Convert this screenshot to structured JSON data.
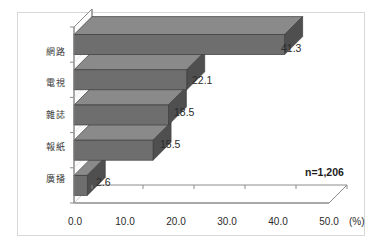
{
  "chart_data": {
    "type": "bar",
    "orientation": "horizontal",
    "style": "3d",
    "title": "",
    "subtitle": "",
    "xlabel": "",
    "ylabel": "",
    "unit_label": "(%)",
    "categories": [
      "網路",
      "電視",
      "雜誌",
      "報紙",
      "廣播"
    ],
    "values": [
      41.3,
      22.1,
      18.5,
      15.5,
      2.6
    ],
    "value_labels": [
      "41.3",
      "22.1",
      "18.5",
      "15.5",
      "2.6"
    ],
    "xlim": [
      0.0,
      50.0
    ],
    "xticks": [
      0.0,
      10.0,
      20.0,
      30.0,
      40.0,
      50.0
    ],
    "xtick_labels": [
      "0.0",
      "10.0",
      "20.0",
      "30.0",
      "40.0",
      "50.0"
    ],
    "grid": false,
    "legend": null,
    "annotations": [
      {
        "text": "n=1,206",
        "position": "lower-right"
      }
    ],
    "colors": {
      "bar_front": "#6e6e6e",
      "bar_top": "#8a8a8a",
      "bar_side": "#4f4f4f",
      "axis": "#8c8c8c",
      "wall": "#f2f2f2",
      "text": "#2b2b2b",
      "border": "#d8d8d8",
      "background": "#ffffff"
    }
  },
  "annotation": {
    "sample_size": "n=1,206"
  },
  "axis": {
    "unit": "(%)"
  }
}
